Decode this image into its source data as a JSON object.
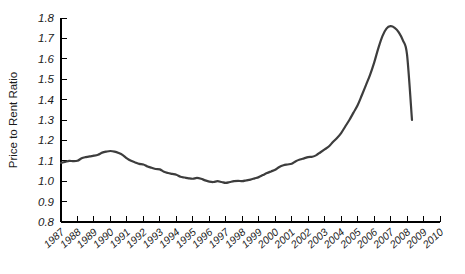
{
  "chart_data": {
    "type": "line",
    "title": "",
    "xlabel": "",
    "ylabel": "Price to Rent Ratio",
    "xlim": [
      1987,
      2010
    ],
    "ylim": [
      0.8,
      1.8
    ],
    "grid": false,
    "legend": null,
    "line_color": "#3d3d3d",
    "axis_color": "#000000",
    "background_color": "#ffffff",
    "ytick_labels": [
      "0.8",
      "0.9",
      "1.0",
      "1.1",
      "1.2",
      "1.3",
      "1.4",
      "1.5",
      "1.6",
      "1.7",
      "1.8"
    ],
    "ytick_values": [
      0.8,
      0.9,
      1.0,
      1.1,
      1.2,
      1.3,
      1.4,
      1.5,
      1.6,
      1.7,
      1.8
    ],
    "xtick_labels": [
      "1987",
      "1988",
      "1989",
      "1990",
      "1991",
      "1992",
      "1993",
      "1994",
      "1995",
      "1996",
      "1997",
      "1998",
      "1999",
      "2000",
      "2001",
      "2002",
      "2003",
      "2004",
      "2005",
      "2006",
      "2007",
      "2008",
      "2009",
      "2010"
    ],
    "xtick_values": [
      1987,
      1988,
      1989,
      1990,
      1991,
      1992,
      1993,
      1994,
      1995,
      1996,
      1997,
      1998,
      1999,
      2000,
      2001,
      2002,
      2003,
      2004,
      2005,
      2006,
      2007,
      2008,
      2009,
      2010
    ],
    "series": [
      {
        "name": "Price to Rent Ratio",
        "x": [
          1987.0,
          1987.25,
          1987.5,
          1987.75,
          1988.0,
          1988.25,
          1988.5,
          1988.75,
          1989.0,
          1989.25,
          1989.5,
          1989.75,
          1990.0,
          1990.25,
          1990.5,
          1990.75,
          1991.0,
          1991.25,
          1991.5,
          1991.75,
          1992.0,
          1992.25,
          1992.5,
          1992.75,
          1993.0,
          1993.25,
          1993.5,
          1993.75,
          1994.0,
          1994.25,
          1994.5,
          1994.75,
          1995.0,
          1995.25,
          1995.5,
          1995.75,
          1996.0,
          1996.25,
          1996.5,
          1996.75,
          1997.0,
          1997.25,
          1997.5,
          1997.75,
          1998.0,
          1998.25,
          1998.5,
          1998.75,
          1999.0,
          1999.25,
          1999.5,
          1999.75,
          2000.0,
          2000.25,
          2000.5,
          2000.75,
          2001.0,
          2001.25,
          2001.5,
          2001.75,
          2002.0,
          2002.25,
          2002.5,
          2002.75,
          2003.0,
          2003.25,
          2003.5,
          2003.75,
          2004.0,
          2004.25,
          2004.5,
          2004.75,
          2005.0,
          2005.25,
          2005.5,
          2005.75,
          2006.0,
          2006.25,
          2006.5,
          2006.75,
          2007.0,
          2007.25,
          2007.5,
          2007.75,
          2008.0,
          2008.3
        ],
        "values": [
          1.09,
          1.095,
          1.1,
          1.098,
          1.1,
          1.112,
          1.118,
          1.122,
          1.125,
          1.13,
          1.14,
          1.145,
          1.148,
          1.145,
          1.138,
          1.128,
          1.112,
          1.1,
          1.092,
          1.085,
          1.082,
          1.072,
          1.066,
          1.06,
          1.058,
          1.046,
          1.04,
          1.036,
          1.032,
          1.022,
          1.018,
          1.014,
          1.012,
          1.016,
          1.012,
          1.004,
          0.998,
          0.996,
          1.0,
          0.996,
          0.992,
          0.996,
          1.0,
          1.002,
          1.0,
          1.004,
          1.008,
          1.014,
          1.02,
          1.03,
          1.04,
          1.048,
          1.056,
          1.07,
          1.078,
          1.082,
          1.086,
          1.098,
          1.106,
          1.112,
          1.118,
          1.12,
          1.128,
          1.142,
          1.156,
          1.17,
          1.192,
          1.212,
          1.236,
          1.268,
          1.3,
          1.336,
          1.372,
          1.42,
          1.47,
          1.52,
          1.58,
          1.65,
          1.71,
          1.748,
          1.76,
          1.752,
          1.73,
          1.69,
          1.62,
          1.3
        ]
      }
    ]
  }
}
